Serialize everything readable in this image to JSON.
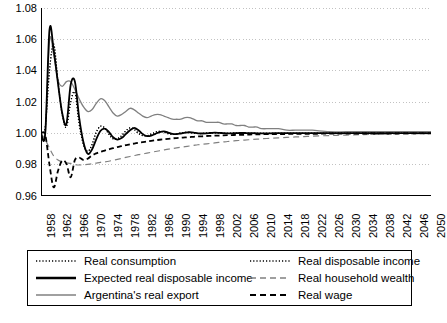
{
  "chart_data": {
    "type": "line",
    "title": "",
    "xlabel": "",
    "ylabel": "",
    "xlim": [
      1958,
      2050
    ],
    "ylim": [
      0.96,
      1.08
    ],
    "ytick_labels": [
      "1.08",
      "1.06",
      "1.04",
      "1.02",
      "1.00",
      "0.98",
      "0.96"
    ],
    "ytick_values": [
      1.08,
      1.06,
      1.04,
      1.02,
      1.0,
      0.98,
      0.96
    ],
    "xtick_labels": [
      "1958",
      "1962",
      "1966",
      "1970",
      "1974",
      "1978",
      "1982",
      "1986",
      "1990",
      "1994",
      "1998",
      "2002",
      "2006",
      "2010",
      "2014",
      "2018",
      "2022",
      "2026",
      "2030",
      "2034",
      "2038",
      "2042",
      "2046",
      "2050"
    ],
    "xtick_values": [
      1958,
      1962,
      1966,
      1970,
      1974,
      1978,
      1982,
      1986,
      1990,
      1994,
      1998,
      2002,
      2006,
      2010,
      2014,
      2018,
      2022,
      2026,
      2030,
      2034,
      2038,
      2042,
      2046,
      2050
    ],
    "grid": true,
    "grid_style": "dotted-horizontal",
    "legend_position": "below-plot",
    "x": [
      1958,
      1959,
      1960,
      1961,
      1962,
      1963,
      1964,
      1965,
      1966,
      1967,
      1968,
      1969,
      1970,
      1971,
      1972,
      1973,
      1974,
      1975,
      1976,
      1977,
      1978,
      1979,
      1980,
      1981,
      1982,
      1983,
      1984,
      1985,
      1986,
      1987,
      1988,
      1989,
      1990,
      1991,
      1992,
      1993,
      1994,
      1995,
      1996,
      1997,
      1998,
      1999,
      2000,
      2001,
      2002,
      2003,
      2004,
      2005,
      2006,
      2007,
      2008,
      2009,
      2010,
      2012,
      2014,
      2016,
      2018,
      2020,
      2022,
      2026,
      2030,
      2034,
      2038,
      2042,
      2046,
      2050
    ],
    "series": [
      {
        "name": "Real consumption",
        "style": "dotted",
        "color": "#000000",
        "width": 1.2,
        "values": [
          1.0,
          1.004,
          1.04,
          1.057,
          1.033,
          1.012,
          1.004,
          1.02,
          1.026,
          1.006,
          0.993,
          0.9885,
          0.9925,
          1.0005,
          1.0045,
          1.0035,
          0.9995,
          0.9965,
          0.9965,
          0.9985,
          1.0015,
          1.0035,
          1.0025,
          1.0,
          0.9985,
          0.9985,
          0.9995,
          1.0008,
          1.0013,
          1.0008,
          0.9998,
          0.9993,
          0.9996,
          1.0002,
          1.0006,
          1.0006,
          1.0002,
          0.9999,
          0.9999,
          1.0001,
          1.0003,
          1.0003,
          1.0002,
          1.0,
          1.0,
          1.0001,
          1.0001,
          1.0001,
          1.0001,
          1.0,
          1.0,
          1.0,
          1.0,
          1.0,
          1.0,
          1.0,
          1.0,
          1.0,
          1.0,
          1.0,
          1.0,
          1.0,
          1.0,
          1.0,
          1.0,
          1.0
        ]
      },
      {
        "name": "Real disposable income",
        "style": "dotted",
        "color": "#000000",
        "width": 1.2,
        "values": [
          1.0,
          1.004,
          1.04,
          1.057,
          1.033,
          1.012,
          1.004,
          1.02,
          1.026,
          1.006,
          0.993,
          0.9885,
          0.9925,
          1.0005,
          1.0045,
          1.0035,
          0.9995,
          0.9965,
          0.9965,
          0.9985,
          1.0015,
          1.0035,
          1.0025,
          1.0,
          0.9985,
          0.9985,
          0.9995,
          1.0008,
          1.0013,
          1.0008,
          0.9998,
          0.9993,
          0.9996,
          1.0002,
          1.0006,
          1.0006,
          1.0002,
          0.9999,
          0.9999,
          1.0001,
          1.0003,
          1.0003,
          1.0002,
          1.0,
          1.0,
          1.0001,
          1.0001,
          1.0001,
          1.0001,
          1.0,
          1.0,
          1.0,
          1.0,
          1.0,
          1.0,
          1.0,
          1.0,
          1.0,
          1.0,
          1.0,
          1.0,
          1.0,
          1.0,
          1.0,
          1.0,
          1.0
        ]
      },
      {
        "name": "Expected real disposable income",
        "style": "solid",
        "color": "#000000",
        "width": 1.8,
        "values": [
          1.0,
          1.0,
          1.066,
          1.053,
          1.032,
          1.013,
          1.006,
          1.031,
          1.033,
          1.01,
          0.9945,
          0.987,
          0.9895,
          0.996,
          1.0015,
          1.003,
          1.001,
          0.9975,
          0.996,
          0.997,
          0.9995,
          1.002,
          1.0035,
          1.002,
          0.9995,
          0.9982,
          0.9985,
          0.9997,
          1.0008,
          1.0012,
          1.0005,
          0.9996,
          0.9995,
          0.9999,
          1.0004,
          1.0007,
          1.0005,
          1.0,
          0.9999,
          1.0,
          1.0002,
          1.0004,
          1.0003,
          1.0001,
          1.0,
          1.0,
          1.0001,
          1.0002,
          1.0002,
          1.0001,
          1.0001,
          1.0,
          1.0,
          1.0,
          1.0001,
          1.0001,
          1.0001,
          1.0001,
          1.0001,
          1.0001,
          1.0001,
          1.0001,
          1.0001,
          1.0001,
          1.0001,
          1.0001
        ]
      },
      {
        "name": "Real household wealth",
        "style": "dashed-long",
        "color": "#808080",
        "width": 1.2,
        "values": [
          1.0,
          0.996,
          0.9905,
          0.9855,
          0.983,
          0.9818,
          0.9812,
          0.9808,
          0.98,
          0.9798,
          0.98,
          0.9802,
          0.9805,
          0.981,
          0.9815,
          0.9818,
          0.9822,
          0.9828,
          0.9834,
          0.984,
          0.9846,
          0.9852,
          0.9858,
          0.9864,
          0.9869,
          0.9874,
          0.9879,
          0.9884,
          0.9889,
          0.9894,
          0.9899,
          0.9903,
          0.9907,
          0.9911,
          0.9915,
          0.9919,
          0.9923,
          0.9927,
          0.993,
          0.9933,
          0.9936,
          0.9939,
          0.9942,
          0.9945,
          0.9948,
          0.995,
          0.9953,
          0.9955,
          0.9957,
          0.9959,
          0.9961,
          0.9963,
          0.9965,
          0.9968,
          0.9971,
          0.9974,
          0.9977,
          0.9979,
          0.9982,
          0.9986,
          0.9989,
          0.9992,
          0.9994,
          0.9996,
          0.9997,
          0.9998
        ]
      },
      {
        "name": "Argentina's real export",
        "style": "solid",
        "color": "#808080",
        "width": 1.3,
        "values": [
          1.0,
          1.0,
          1.059,
          1.05,
          1.034,
          1.03,
          1.033,
          1.033,
          1.028,
          1.022,
          1.017,
          1.014,
          1.015,
          1.019,
          1.022,
          1.021,
          1.017,
          1.013,
          1.011,
          1.012,
          1.014,
          1.016,
          1.015,
          1.013,
          1.011,
          1.01,
          1.011,
          1.012,
          1.012,
          1.011,
          1.01,
          1.009,
          1.009,
          1.009,
          1.01,
          1.01,
          1.009,
          1.008,
          1.008,
          1.007,
          1.007,
          1.007,
          1.007,
          1.006,
          1.006,
          1.006,
          1.005,
          1.005,
          1.005,
          1.004,
          1.004,
          1.004,
          1.003,
          1.003,
          1.003,
          1.002,
          1.002,
          1.002,
          1.002,
          1.001,
          1.001,
          1.001,
          1.001,
          1.001,
          1.001,
          1.001
        ]
      },
      {
        "name": "Real wage",
        "style": "dashed",
        "color": "#000000",
        "width": 1.8,
        "values": [
          1.0,
          0.999,
          0.98,
          0.9655,
          0.976,
          0.9825,
          0.9805,
          0.972,
          0.983,
          0.9845,
          0.983,
          0.9838,
          0.9858,
          0.9872,
          0.9882,
          0.989,
          0.9898,
          0.9905,
          0.9912,
          0.9918,
          0.9924,
          0.993,
          0.9935,
          0.994,
          0.9944,
          0.9948,
          0.9952,
          0.9956,
          0.9959,
          0.9962,
          0.9965,
          0.9968,
          0.997,
          0.9972,
          0.9974,
          0.9976,
          0.9978,
          0.998,
          0.9981,
          0.9983,
          0.9984,
          0.9985,
          0.9986,
          0.9987,
          0.9988,
          0.9989,
          0.999,
          0.9991,
          0.9991,
          0.9992,
          0.9993,
          0.9993,
          0.9994,
          0.9995,
          0.9995,
          0.9996,
          0.9996,
          0.9997,
          0.9997,
          0.9998,
          0.9998,
          0.9999,
          0.9999,
          0.9999,
          1.0,
          1.0
        ]
      }
    ]
  },
  "axis": {
    "y_labels": [
      "1.08",
      "1.06",
      "1.04",
      "1.02",
      "1.00",
      "0.98",
      "0.96"
    ],
    "x_labels": [
      "1958",
      "1962",
      "1966",
      "1970",
      "1974",
      "1978",
      "1982",
      "1986",
      "1990",
      "1994",
      "1998",
      "2002",
      "2006",
      "2010",
      "2014",
      "2018",
      "2022",
      "2026",
      "2030",
      "2034",
      "2038",
      "2042",
      "2046",
      "2050"
    ]
  },
  "legend": {
    "entries": [
      {
        "label": "Real consumption",
        "style": "dotted",
        "color": "#000000",
        "col": 0,
        "row": 0
      },
      {
        "label": "Real disposable income",
        "style": "dotted",
        "color": "#000000",
        "col": 1,
        "row": 0
      },
      {
        "label": "Expected real disposable income",
        "style": "solid-thick",
        "color": "#000000",
        "col": 0,
        "row": 1
      },
      {
        "label": "Real household wealth",
        "style": "dashed-long",
        "color": "#808080",
        "col": 1,
        "row": 1
      },
      {
        "label": "Argentina's real export",
        "style": "solid-thin",
        "color": "#808080",
        "col": 0,
        "row": 2
      },
      {
        "label": "Real wage",
        "style": "dashed-thick",
        "color": "#000000",
        "col": 1,
        "row": 2
      }
    ]
  },
  "colors": {
    "axis": "#000000",
    "grid": "#bbbbbb",
    "black": "#000000",
    "gray": "#808080",
    "background": "#ffffff"
  }
}
